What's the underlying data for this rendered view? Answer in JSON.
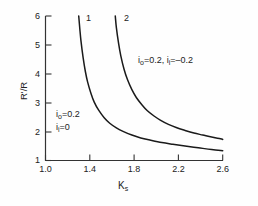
{
  "chart_data": {
    "type": "line",
    "title": "",
    "subtitle": "",
    "xlabel": "K_s",
    "xlabel_base": "K",
    "xlabel_sub": "s",
    "ylabel": "R'/R",
    "xlim": [
      1.0,
      2.6
    ],
    "ylim": [
      1,
      6
    ],
    "xticks": [
      "1.0",
      "1.4",
      "1.8",
      "2.2",
      "2.6"
    ],
    "xtick_values": [
      1.0,
      1.4,
      1.8,
      2.2,
      2.6
    ],
    "yticks": [
      "1",
      "2",
      "3",
      "4",
      "5",
      "6"
    ],
    "ytick_values": [
      1,
      2,
      3,
      4,
      5,
      6
    ],
    "grid": false,
    "legend_position": "inline-annotations",
    "line_color": "#1a1a1a",
    "axis_color": "#333333",
    "background_color": "#fefefe",
    "series": [
      {
        "name": "1",
        "curve_label": "1",
        "annotation_line1": "i_o = 0.2",
        "annotation_line2": "i_i = 0",
        "x": [
          1.3,
          1.31,
          1.32,
          1.34,
          1.36,
          1.38,
          1.41,
          1.44,
          1.48,
          1.53,
          1.58,
          1.64,
          1.7,
          1.78,
          1.86,
          1.95,
          2.05,
          2.15,
          2.26,
          2.38,
          2.5,
          2.6
        ],
        "values": [
          6.0,
          5.55,
          5.15,
          4.55,
          4.08,
          3.72,
          3.33,
          3.02,
          2.74,
          2.48,
          2.29,
          2.13,
          2.01,
          1.88,
          1.78,
          1.7,
          1.62,
          1.56,
          1.5,
          1.44,
          1.38,
          1.34
        ]
      },
      {
        "name": "2",
        "curve_label": "2",
        "annotation_line1": "i_o = 0.2, i_i = -0.2",
        "x": [
          1.63,
          1.64,
          1.66,
          1.68,
          1.71,
          1.74,
          1.78,
          1.82,
          1.87,
          1.92,
          1.98,
          2.04,
          2.11,
          2.18,
          2.26,
          2.34,
          2.42,
          2.5,
          2.58,
          2.6
        ],
        "values": [
          6.0,
          5.6,
          5.05,
          4.62,
          4.15,
          3.8,
          3.45,
          3.18,
          2.93,
          2.72,
          2.54,
          2.39,
          2.25,
          2.14,
          2.04,
          1.95,
          1.88,
          1.81,
          1.75,
          1.73
        ]
      }
    ],
    "annotations": [
      {
        "id": "annot-curve-1",
        "line1_base": "i",
        "line1_sub": "o",
        "line1_rest": " = 0.2",
        "line2_base": "i",
        "line2_sub": "i",
        "line2_rest": " = 0",
        "text": "i_o = 0.2 / i_i = 0"
      },
      {
        "id": "annot-curve-2",
        "part1_base": "i",
        "part1_sub": "o",
        "part1_rest": " = 0.2, ",
        "part2_base": "i",
        "part2_sub": "i",
        "part2_rest": " = –0.2",
        "text": "i_o = 0.2, i_i = -0.2"
      }
    ]
  },
  "labels": {
    "curve1_id": "1",
    "curve2_id": "2",
    "ytick_6": "6",
    "ytick_5": "5",
    "ytick_4": "4",
    "ytick_3": "3",
    "ytick_2": "2",
    "ytick_1": "1",
    "xtick_10": "1.0",
    "xtick_14": "1.4",
    "xtick_18": "1.8",
    "xtick_22": "2.2",
    "xtick_26": "2.6",
    "y_axis_title": "R'/R",
    "x_axis_title_base": "K",
    "x_axis_title_sub": "s",
    "annot1_l1_base": "i",
    "annot1_l1_sub": "o",
    "annot1_l1_rest": "=0.2",
    "annot1_l2_base": "i",
    "annot1_l2_sub": "i",
    "annot1_l2_rest": "=0",
    "annot2_p1_base": "i",
    "annot2_p1_sub": "o",
    "annot2_p1_rest": "=0.2, ",
    "annot2_p2_base": "i",
    "annot2_p2_sub": "i",
    "annot2_p2_rest": "=–0.2"
  }
}
